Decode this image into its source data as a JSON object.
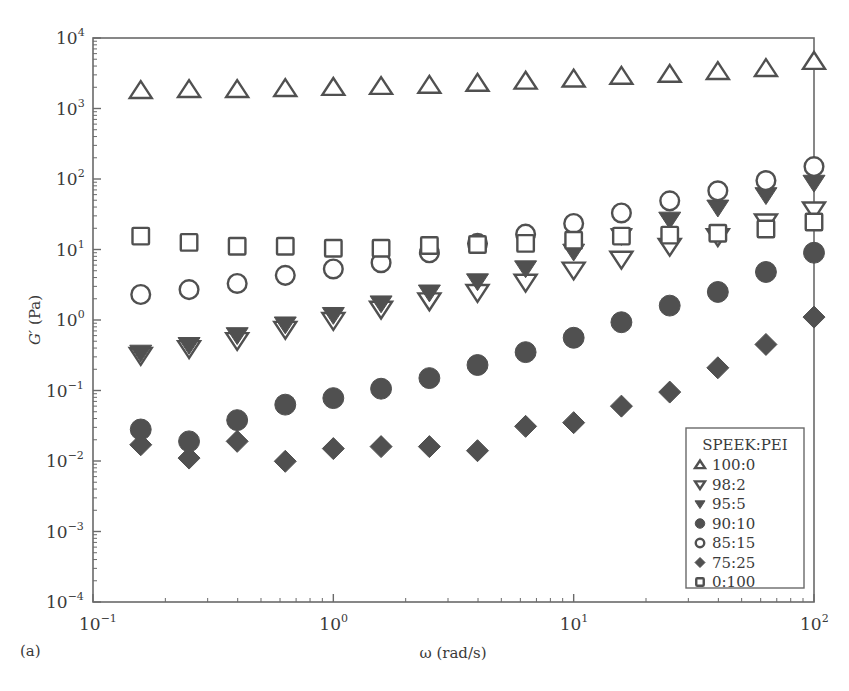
{
  "panel_label": "(a)",
  "chart_data": {
    "type": "scatter",
    "title": "",
    "xlabel": "ω (rad/s)",
    "ylabel": "G′ (Pa)",
    "xscale": "log",
    "yscale": "log",
    "xlim": [
      0.1,
      100
    ],
    "ylim": [
      0.0001,
      10000
    ],
    "x_ticks": [
      {
        "base": "10",
        "exp": "−1",
        "value": 0.1
      },
      {
        "base": "10",
        "exp": "0",
        "value": 1
      },
      {
        "base": "10",
        "exp": "1",
        "value": 10
      },
      {
        "base": "10",
        "exp": "2",
        "value": 100
      }
    ],
    "y_ticks": [
      {
        "base": "10",
        "exp": "4",
        "value": 10000
      },
      {
        "base": "10",
        "exp": "3",
        "value": 1000
      },
      {
        "base": "10",
        "exp": "2",
        "value": 100
      },
      {
        "base": "10",
        "exp": "1",
        "value": 10
      },
      {
        "base": "10",
        "exp": "0",
        "value": 1
      },
      {
        "base": "10",
        "exp": "−1",
        "value": 0.1
      },
      {
        "base": "10",
        "exp": "−2",
        "value": 0.01
      },
      {
        "base": "10",
        "exp": "−3",
        "value": 0.001
      },
      {
        "base": "10",
        "exp": "−4",
        "value": 0.0001
      }
    ],
    "grid": false,
    "legend_title": "SPEEK:PEI",
    "legend_position": "lower right",
    "x": [
      0.158,
      0.251,
      0.398,
      0.631,
      1.0,
      1.58,
      2.51,
      3.98,
      6.31,
      10.0,
      15.8,
      25.1,
      39.8,
      63.1,
      100.0
    ],
    "series": [
      {
        "name": "100:0",
        "marker": "triangle-up-open",
        "values": [
          1770,
          1830,
          1830,
          1890,
          1960,
          2020,
          2100,
          2240,
          2400,
          2570,
          2820,
          3000,
          3290,
          3630,
          4580
        ]
      },
      {
        "name": "98:2",
        "marker": "triangle-down-open",
        "values": [
          0.32,
          0.4,
          0.52,
          0.75,
          1.0,
          1.45,
          1.9,
          2.5,
          3.5,
          5.2,
          7.4,
          11.3,
          15.5,
          25,
          37
        ]
      },
      {
        "name": "95:5",
        "marker": "triangle-down-filled",
        "values": [
          0.35,
          0.45,
          0.62,
          0.88,
          1.2,
          1.75,
          2.5,
          3.6,
          5.5,
          9.5,
          15.8,
          27,
          40,
          60,
          90
        ]
      },
      {
        "name": "90:10",
        "marker": "circle-filled",
        "values": [
          0.028,
          0.019,
          0.038,
          0.063,
          0.078,
          0.106,
          0.15,
          0.23,
          0.35,
          0.56,
          0.93,
          1.6,
          2.5,
          4.8,
          9.0
        ]
      },
      {
        "name": "85:15",
        "marker": "circle-open",
        "values": [
          2.3,
          2.7,
          3.3,
          4.3,
          5.3,
          6.5,
          9.0,
          12.2,
          16.5,
          23.4,
          33,
          49,
          68,
          95,
          150
        ]
      },
      {
        "name": "75:25",
        "marker": "diamond-filled",
        "values": [
          0.017,
          0.011,
          0.019,
          0.0099,
          0.015,
          0.016,
          0.016,
          0.014,
          0.031,
          0.035,
          0.06,
          0.095,
          0.21,
          0.45,
          1.1
        ]
      },
      {
        "name": "0:100",
        "marker": "square-open",
        "values": [
          15.5,
          12.6,
          11.1,
          11.1,
          10.4,
          10.4,
          11.4,
          11.8,
          12.2,
          13.5,
          15.5,
          16,
          17,
          19.5,
          24.5
        ]
      }
    ]
  },
  "colors": {
    "marker": "#505050",
    "axis": "#6a6a6a",
    "text": "#3a3a3a",
    "background": "#ffffff"
  }
}
